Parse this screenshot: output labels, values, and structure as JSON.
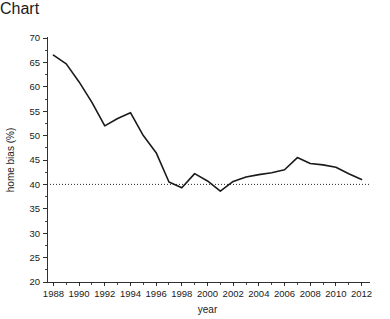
{
  "chart_data": {
    "type": "line",
    "title": "",
    "xlabel": "year",
    "ylabel": "home bias (%)",
    "x": [
      1988,
      1989,
      1990,
      1991,
      1992,
      1993,
      1994,
      1995,
      1996,
      1997,
      1998,
      1999,
      2000,
      2001,
      2002,
      2003,
      2004,
      2005,
      2006,
      2007,
      2008,
      2009,
      2010,
      2011,
      2012
    ],
    "values": [
      66.5,
      64.7,
      61.0,
      56.8,
      52.0,
      53.5,
      54.7,
      50.0,
      46.5,
      40.5,
      39.3,
      42.2,
      40.7,
      38.6,
      40.6,
      41.5,
      42.0,
      42.4,
      43.0,
      45.5,
      44.3,
      44.0,
      43.5,
      42.2,
      41.0
    ],
    "series": [
      {
        "name": "home bias",
        "values": [
          66.5,
          64.7,
          61.0,
          56.8,
          52.0,
          53.5,
          54.7,
          50.0,
          46.5,
          40.5,
          39.3,
          42.2,
          40.7,
          38.6,
          40.6,
          41.5,
          42.0,
          42.4,
          43.0,
          45.5,
          44.3,
          44.0,
          43.5,
          42.2,
          41.0
        ]
      }
    ],
    "reference_line": {
      "label": "",
      "value": 40,
      "style": "dotted"
    },
    "xlim": [
      1987.5,
      2012.5
    ],
    "ylim": [
      20,
      70
    ],
    "y_ticks": [
      20,
      25,
      30,
      35,
      40,
      45,
      50,
      55,
      60,
      65,
      70
    ],
    "y_tick_labels": [
      "20",
      "25",
      "30",
      "35",
      "40",
      "45",
      "50",
      "55",
      "60",
      "65",
      "70"
    ],
    "x_ticks": [
      1988,
      1990,
      1992,
      1994,
      1996,
      1998,
      2000,
      2002,
      2004,
      2006,
      2008,
      2010,
      2012
    ],
    "x_tick_labels": [
      "1988",
      "1990",
      "1992",
      "1994",
      "1996",
      "1998",
      "2000",
      "2002",
      "2004",
      "2006",
      "2008",
      "2010",
      "2012"
    ],
    "x_minor_ticks": [
      1989,
      1991,
      1993,
      1995,
      1997,
      1999,
      2001,
      2003,
      2005,
      2007,
      2009,
      2011
    ],
    "y_minor_ticks": [
      22.5,
      27.5,
      32.5,
      37.5,
      42.5,
      47.5,
      52.5,
      57.5,
      62.5,
      67.5
    ],
    "grid": false,
    "legend": null,
    "line_color": "#1a1a1a",
    "background_color": "#ffffff"
  }
}
